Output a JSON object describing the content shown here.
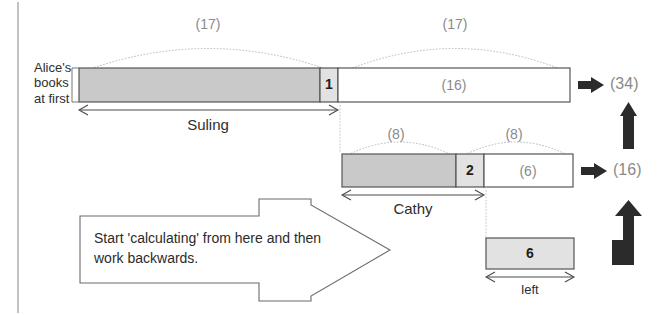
{
  "diagram": {
    "left_label": {
      "line1": "Alice's",
      "line2": "books",
      "line3": "at first"
    },
    "rows": [
      {
        "id": "alice-row",
        "arcs": [
          {
            "name": "arc-17-left",
            "label": "(17)"
          },
          {
            "name": "arc-17-right",
            "label": "(17)"
          }
        ],
        "segments": [
          {
            "name": "suling-shaded-segment",
            "label": "",
            "fill": "shaded"
          },
          {
            "name": "unit-cell-1",
            "label": "1",
            "fill": "light"
          },
          {
            "name": "remainder-16-segment",
            "label": "(16)",
            "fill": "white"
          }
        ],
        "brace_label": "Suling",
        "total": "(34)"
      },
      {
        "id": "cathy-row",
        "arcs": [
          {
            "name": "arc-8-left",
            "label": "(8)"
          },
          {
            "name": "arc-8-right",
            "label": "(8)"
          }
        ],
        "segments": [
          {
            "name": "cathy-shaded-segment",
            "label": "",
            "fill": "shaded"
          },
          {
            "name": "unit-cell-2",
            "label": "2",
            "fill": "light"
          },
          {
            "name": "remainder-6-segment",
            "label": "(6)",
            "fill": "white"
          }
        ],
        "brace_label": "Cathy",
        "total": "(16)"
      },
      {
        "id": "left-row",
        "arcs": [],
        "segments": [
          {
            "name": "left-bar-segment",
            "label": "6",
            "fill": "light"
          }
        ],
        "brace_label": "left",
        "total": ""
      }
    ],
    "callout": {
      "line1": "Start 'calculating' from here and then",
      "line2": "work backwards."
    },
    "flow_arrows": [
      {
        "name": "flow-arrow-up-top",
        "shape": "arrow-up"
      },
      {
        "name": "flow-arrow-up-bent-bottom",
        "shape": "arrow-up-bent"
      }
    ],
    "result_arrows": [
      {
        "name": "result-arrow-34",
        "shape": "arrow-right"
      },
      {
        "name": "result-arrow-16",
        "shape": "arrow-right"
      }
    ],
    "colors": {
      "shaded_fill": "#c9c9c9",
      "light_fill": "#e2e2e2",
      "white_fill": "#ffffff",
      "stroke": "#555555",
      "arrow_fill": "#2b2b2b",
      "grey_text": "#8a8a8a",
      "dotted_guide": "#bdbdbd"
    }
  }
}
